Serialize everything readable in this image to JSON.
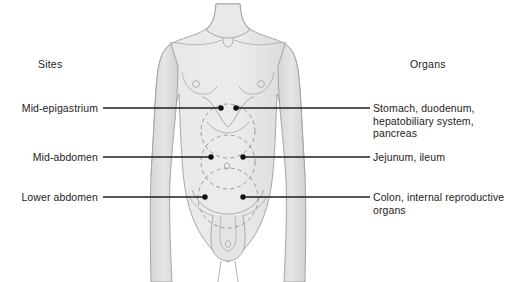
{
  "figure": {
    "title_sites": "Sites",
    "title_organs": "Organs",
    "background_color": "#ffffff",
    "body_fill_color": "#e6e6e6",
    "body_outline_color": "#9a9a9a",
    "dashed_circle_color": "#9a9a9a",
    "leader_line_color": "#1c1c1c",
    "text_color": "#1c1c1c"
  },
  "rows": [
    {
      "site": "Mid-epigastrium",
      "organs": "Stomach, duodenum,\nhepatobiliary system,\npancreas"
    },
    {
      "site": "Mid-abdomen",
      "organs": "Jejunum, ileum"
    },
    {
      "site": "Lower abdomen",
      "organs": "Colon, internal reproductive\norgans"
    }
  ],
  "diagram": {
    "region_circles": [
      {
        "name": "mid-epigastrium-region",
        "cx": 228,
        "cy": 131,
        "r": 27
      },
      {
        "name": "mid-abdomen-region",
        "cx": 228,
        "cy": 162,
        "r": 27
      },
      {
        "name": "lower-abdomen-region",
        "cx": 228,
        "cy": 198,
        "r": 30
      }
    ],
    "marker_dots": [
      {
        "name": "mid-epigastrium-dot-left",
        "x": 221,
        "y": 108
      },
      {
        "name": "mid-epigastrium-dot-right",
        "x": 236,
        "y": 108
      },
      {
        "name": "mid-abdomen-dot-left",
        "x": 211,
        "y": 157
      },
      {
        "name": "mid-abdomen-dot-right",
        "x": 243,
        "y": 157
      },
      {
        "name": "lower-abdomen-dot-left",
        "x": 205,
        "y": 197
      },
      {
        "name": "lower-abdomen-dot-right",
        "x": 243,
        "y": 197
      }
    ],
    "leader_lines": [
      {
        "name": "leader-left-mid-epigastrium",
        "x1": 103,
        "y1": 108,
        "x2": 221,
        "y2": 108
      },
      {
        "name": "leader-right-mid-epigastrium",
        "x1": 236,
        "y1": 108,
        "x2": 370,
        "y2": 108
      },
      {
        "name": "leader-left-mid-abdomen",
        "x1": 103,
        "y1": 157,
        "x2": 211,
        "y2": 157
      },
      {
        "name": "leader-right-mid-abdomen",
        "x1": 243,
        "y1": 157,
        "x2": 370,
        "y2": 157
      },
      {
        "name": "leader-left-lower-abdomen",
        "x1": 103,
        "y1": 197,
        "x2": 205,
        "y2": 197
      },
      {
        "name": "leader-right-lower-abdomen",
        "x1": 243,
        "y1": 197,
        "x2": 370,
        "y2": 197
      }
    ]
  }
}
